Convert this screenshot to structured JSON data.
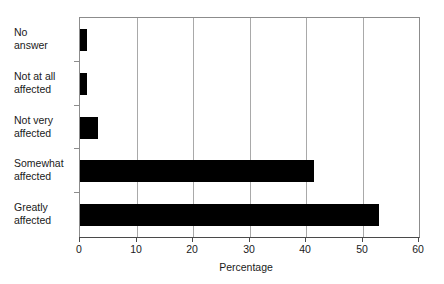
{
  "chart_data": {
    "type": "bar",
    "orientation": "horizontal",
    "title": "",
    "xlabel": "Percentage",
    "ylabel": "",
    "categories": [
      "No\nanswer",
      "Not at all\naffected",
      "Not very\naffected",
      "Somewhat\naffected",
      "Greatly\naffected"
    ],
    "values": [
      1.2,
      1.2,
      3.2,
      41.5,
      53.0
    ],
    "xlim": [
      0,
      60
    ],
    "xticks": [
      0,
      10,
      20,
      30,
      40,
      50,
      60
    ],
    "xtick_labels": [
      "0",
      "10",
      "20",
      "30",
      "40",
      "50",
      "60"
    ],
    "grid": "vertical",
    "legend": "none",
    "bar_color": "#000000",
    "grid_color": "#a9a9a9",
    "axis_color": "#4a4a4a"
  }
}
